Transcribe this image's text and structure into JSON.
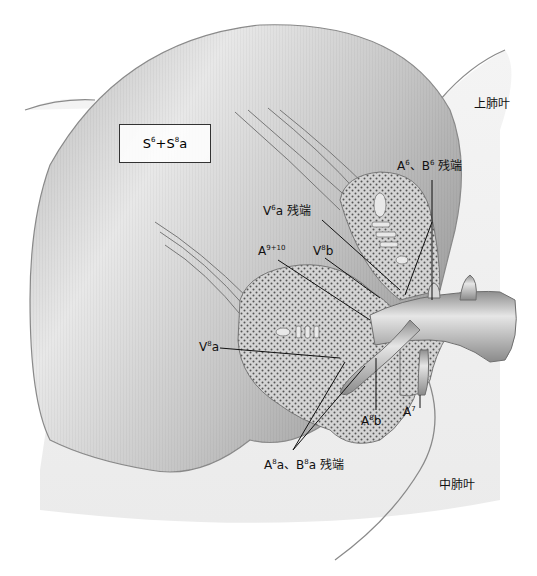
{
  "figure": {
    "segment_box": {
      "base1": "S",
      "sup1": "6",
      "plus": "+",
      "base2": "S",
      "sup2": "8",
      "suffix": "a"
    },
    "lobes": {
      "upper": "上肺叶",
      "middle": "中肺叶"
    },
    "labels": {
      "a6_b6_stump": {
        "p1": "A",
        "s1": "6",
        "sep": "、",
        "p2": "B",
        "s2": "6",
        "tail": " 残端"
      },
      "v6a_stump": {
        "p1": "V",
        "s1": "6",
        "tail": "a 残端"
      },
      "a9_10": {
        "p1": "A",
        "s1": "9+10"
      },
      "v8b": {
        "p1": "V",
        "s1": "8",
        "tail": "b"
      },
      "v8a": {
        "p1": "V",
        "s1": "8",
        "tail": "a"
      },
      "a8b": {
        "p1": "A",
        "s1": "8",
        "tail": "b"
      },
      "a7": {
        "p1": "A",
        "s1": "7"
      },
      "a8a_b8a_stump": {
        "p1": "A",
        "s1": "8",
        "mid": "a、",
        "p2": "B",
        "s2": "8",
        "tail": "a 残端"
      }
    },
    "colors": {
      "lung_surface": "#bdbdbd",
      "lung_light": "#e9e9e9",
      "parenchyma_cut": "#cfcfcf",
      "stipple": "#555555",
      "vessel": "#a8a8a8",
      "leader_line": "#111111"
    }
  }
}
